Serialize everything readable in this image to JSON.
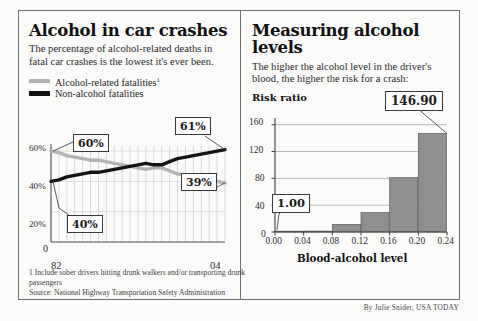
{
  "left": {
    "headline": "Alcohol in car crashes",
    "deck": "The percentage of alcohol-related deaths in fatal car crashes is the lowest it's ever been.",
    "legend": [
      {
        "label": "Alcohol-related fatalities",
        "footnote_marker": "1",
        "color": "#b3b3b3",
        "name": "alcohol-related"
      },
      {
        "label": "Non-alcohol fatalities",
        "footnote_marker": "",
        "color": "#111111",
        "name": "non-alcohol"
      }
    ],
    "callouts": [
      {
        "text": "60%",
        "name": "callout-60"
      },
      {
        "text": "40%",
        "name": "callout-40"
      },
      {
        "text": "61%",
        "name": "callout-61"
      },
      {
        "text": "39%",
        "name": "callout-39"
      }
    ],
    "yticks": [
      "60%",
      "40%",
      "20%",
      "0"
    ],
    "xticks": [
      "82",
      "04"
    ],
    "footnote": "1  Include sober drivers hitting drunk walkers and/or transporting drunk passengers",
    "source": "Source: National Highway Transportation Safety Administration"
  },
  "right": {
    "headline": "Measuring alcohol levels",
    "deck": "The higher the alcohol level in the driver's blood, the higher the risk for a crash:",
    "axis_title": "Risk ratio",
    "xtitle": "Blood-alcohol level",
    "callouts": [
      {
        "text": "146.90",
        "name": "callout-14690"
      },
      {
        "text": "1.00",
        "name": "callout-100"
      }
    ]
  },
  "credit": "By Julie Snider, USA TODAY",
  "chart_data": [
    {
      "type": "line",
      "name": "alcohol-in-car-crashes",
      "title": "Alcohol in car crashes",
      "xlabel": "",
      "ylabel": "",
      "ylim": [
        0,
        70
      ],
      "yticks": [
        0,
        20,
        40,
        60
      ],
      "ytick_labels": [
        "0",
        "20%",
        "40%",
        "60%"
      ],
      "x": [
        1982,
        1983,
        1984,
        1985,
        1986,
        1987,
        1988,
        1989,
        1990,
        1991,
        1992,
        1993,
        1994,
        1995,
        1996,
        1997,
        1998,
        1999,
        2000,
        2001,
        2002,
        2003,
        2004
      ],
      "xtick_labels": [
        "82",
        "04"
      ],
      "grid": true,
      "series": [
        {
          "name": "Alcohol-related fatalities",
          "color": "#b3b3b3",
          "values": [
            60,
            59,
            57,
            56,
            55,
            54,
            54,
            53,
            52,
            51,
            50,
            49,
            48,
            49,
            49,
            47,
            45,
            44,
            43,
            42,
            41,
            40,
            39
          ],
          "endpoint_labels": {
            "start": "60%",
            "end": "39%"
          }
        },
        {
          "name": "Non-alcohol fatalities",
          "color": "#111111",
          "values": [
            40,
            41,
            43,
            44,
            45,
            46,
            46,
            47,
            48,
            49,
            50,
            51,
            52,
            51,
            51,
            53,
            55,
            56,
            57,
            58,
            59,
            60,
            61
          ],
          "endpoint_labels": {
            "start": "40%",
            "end": "61%"
          }
        }
      ]
    },
    {
      "type": "bar",
      "name": "measuring-alcohol-levels",
      "title": "Measuring alcohol levels",
      "xlabel": "Blood-alcohol level",
      "ylabel": "Risk ratio",
      "ylim": [
        0,
        170
      ],
      "yticks": [
        0,
        40,
        80,
        120,
        160
      ],
      "ytick_labels": [
        "0",
        "40",
        "80",
        "120",
        "160"
      ],
      "xtick_labels": [
        "0.00",
        "0.04",
        "0.08",
        "0.12",
        "0.16",
        "0.20",
        "0.24"
      ],
      "grid": true,
      "bar_color": "#8f8f8f",
      "categories": [
        "0.00-0.04",
        "0.04-0.08",
        "0.08-0.12",
        "0.12-0.16",
        "0.16-0.20",
        "0.20-0.24"
      ],
      "values": [
        1.0,
        1.4,
        11.0,
        29.0,
        81.0,
        146.9
      ],
      "annotations": [
        {
          "text": "1.00",
          "target_category": "0.00-0.04"
        },
        {
          "text": "146.90",
          "target_category": "0.20-0.24"
        }
      ]
    }
  ]
}
